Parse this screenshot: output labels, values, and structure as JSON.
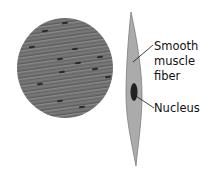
{
  "labels": {
    "fiber_line1": "Smooth",
    "fiber_line2": "muscle",
    "fiber_line3": "fiber",
    "nucleus": "Nucleus"
  },
  "colors": {
    "tissue": "#6e6e6e",
    "fiber_fill": "#a9a9a9",
    "fiber_edge": "#7d7d7d",
    "nucleus": "#222222"
  }
}
